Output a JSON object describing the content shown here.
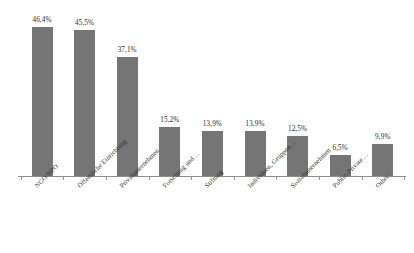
{
  "chart_data": {
    "type": "bar",
    "title": "",
    "subtitle": "",
    "xlabel": "",
    "ylabel": "",
    "ylim": [
      0,
      50
    ],
    "grid": false,
    "legend": null,
    "orientation": "vertical",
    "bar_color": "#757575",
    "axis_color": "#8c8c8c",
    "label_color": "#2b2b2b",
    "decimal_separator": ",",
    "value_suffix": "%",
    "categories": [
      "NGO/NPO",
      "Öffentliche Einrichtung",
      "Privatunternehmen",
      "Forschung und…",
      "Stiftung",
      "Individuen, Gruppen…",
      "Sozialunternehmen",
      "Public-Private…",
      "Other"
    ],
    "values": [
      46.4,
      45.5,
      37.1,
      15.2,
      13.9,
      13.9,
      12.5,
      6.5,
      9.9
    ],
    "value_labels": [
      "46,4%",
      "45,5%",
      "37,1%",
      "15,2%",
      "13,9%",
      "13,9%",
      "12,5%",
      "6,5%",
      "9,9%"
    ]
  }
}
